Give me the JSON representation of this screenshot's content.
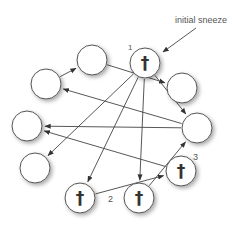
{
  "diagram": {
    "annotation": "initial sneeze",
    "labels": {
      "n1": "1",
      "n2": "2",
      "n3": "3"
    },
    "cross_glyph": "†",
    "colors": {
      "stroke": "#555555",
      "fill": "#ffffff",
      "text": "#333333"
    },
    "nodes": [
      {
        "id": "top",
        "x": 145,
        "y": 63,
        "infected": true,
        "label": "1"
      },
      {
        "id": "upper-left",
        "x": 92,
        "y": 60,
        "infected": false
      },
      {
        "id": "left",
        "x": 46,
        "y": 84,
        "infected": false
      },
      {
        "id": "upper-right",
        "x": 182,
        "y": 88,
        "infected": false
      },
      {
        "id": "far-left",
        "x": 27,
        "y": 126,
        "infected": false
      },
      {
        "id": "right",
        "x": 197,
        "y": 128,
        "infected": false
      },
      {
        "id": "lower-left",
        "x": 35,
        "y": 168,
        "infected": false
      },
      {
        "id": "lower-right",
        "x": 181,
        "y": 171,
        "infected": true,
        "label": "3"
      },
      {
        "id": "bottom-left",
        "x": 80,
        "y": 198,
        "infected": true
      },
      {
        "id": "bottom",
        "x": 139,
        "y": 198,
        "infected": true,
        "label": "2"
      }
    ],
    "edges": [
      {
        "from": "left",
        "to": "upper-left"
      },
      {
        "from": "upper-left",
        "to": "upper-right"
      },
      {
        "from": "top",
        "to": "lower-left"
      },
      {
        "from": "top",
        "to": "bottom-left"
      },
      {
        "from": "top",
        "to": "bottom"
      },
      {
        "from": "top",
        "to": "right"
      },
      {
        "from": "right",
        "to": "left"
      },
      {
        "from": "right",
        "to": "far-left"
      },
      {
        "from": "lower-right",
        "to": "far-left"
      },
      {
        "from": "bottom-left",
        "to": "lower-right"
      },
      {
        "from": "bottom",
        "to": "right"
      }
    ]
  }
}
